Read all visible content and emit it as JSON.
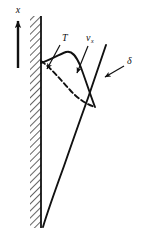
{
  "figure": {
    "background_color": "#ffffff",
    "ink_color": "#111111",
    "width": 145,
    "height": 232
  },
  "axis": {
    "name": "x-axis",
    "label": "x",
    "direction": "up",
    "arrow_x": 18,
    "arrow_tail_y": 68,
    "arrow_head_y": 18,
    "label_x": 18,
    "label_y": 13
  },
  "wall": {
    "name": "hatched-wall",
    "label": "",
    "left": 30,
    "right": 41,
    "top": 16,
    "bottom": 228,
    "hatch_angle_deg": 45,
    "hatch_spacing": 5,
    "surface_line_x": 41
  },
  "labels": {
    "temperature": {
      "text": "T",
      "subscript": "",
      "x": 62,
      "y": 40,
      "leader_from": [
        60,
        44
      ],
      "leader_to": [
        46,
        70
      ]
    },
    "velocity": {
      "text": "v",
      "subscript": "x",
      "x": 88,
      "y": 40,
      "leader_from": [
        88,
        45
      ],
      "leader_to": [
        76,
        74
      ]
    },
    "boundary_layer": {
      "text": "δ",
      "subscript": "",
      "x": 127,
      "y": 63,
      "leader_from": [
        124,
        65
      ],
      "leader_to": [
        104,
        77
      ]
    }
  },
  "curves": {
    "velocity_profile": {
      "name": "velocity-profile-curve",
      "style": "solid",
      "description": "v_x profile rising from wall to a hump then decaying to zero at delta",
      "points": [
        [
          41,
          63
        ],
        [
          45,
          62
        ],
        [
          50,
          60
        ],
        [
          55,
          57
        ],
        [
          60,
          54
        ],
        [
          64,
          52
        ],
        [
          68,
          52
        ],
        [
          71,
          54
        ],
        [
          75,
          58
        ],
        [
          79,
          64
        ],
        [
          84,
          74
        ],
        [
          88,
          86
        ],
        [
          92,
          98
        ],
        [
          95,
          107
        ]
      ]
    },
    "temperature_profile": {
      "name": "temperature-profile-curve",
      "style": "dashed",
      "dash_pattern": "5,3",
      "description": "T profile decaying monotonically from wall to ambient at delta",
      "points": [
        [
          41,
          61
        ],
        [
          46,
          64
        ],
        [
          52,
          69
        ],
        [
          58,
          76
        ],
        [
          64,
          83
        ],
        [
          70,
          90
        ],
        [
          76,
          96
        ],
        [
          82,
          101
        ],
        [
          88,
          105
        ],
        [
          95,
          107
        ]
      ]
    },
    "boundary_layer_edge": {
      "name": "boundary-layer-edge-curve",
      "style": "solid",
      "description": "delta: boundary layer thickness growing with height, from wall base up to top right",
      "points": [
        [
          43,
          227
        ],
        [
          47,
          215
        ],
        [
          53,
          198
        ],
        [
          60,
          178
        ],
        [
          67,
          158
        ],
        [
          74,
          138
        ],
        [
          81,
          118
        ],
        [
          88,
          98
        ],
        [
          94,
          80
        ],
        [
          99,
          64
        ],
        [
          103,
          52
        ],
        [
          106,
          45
        ]
      ]
    }
  },
  "arrowheads": [
    {
      "name": "temperature-leader-arrowhead",
      "tip": [
        46,
        70
      ],
      "angle_deg": 118
    },
    {
      "name": "velocity-leader-arrowhead",
      "tip": [
        76,
        74
      ],
      "angle_deg": 112
    },
    {
      "name": "boundary-layer-leader-arrowhead",
      "tip": [
        104,
        77
      ],
      "angle_deg": 210
    },
    {
      "name": "x-axis-arrowhead",
      "tip": [
        18,
        18
      ],
      "angle_deg": 270
    }
  ]
}
